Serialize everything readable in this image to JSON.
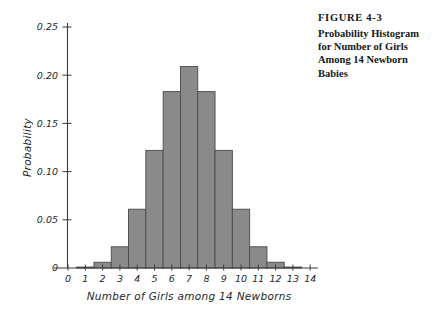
{
  "caption": {
    "figure_number": "FIGURE 4-3",
    "title_lines": [
      "Probability Histogram",
      "for Number of Girls",
      "Among 14 Newborn",
      "Babies"
    ],
    "title_text": "Probability Histogram for Number of Girls Among 14 Newborn Babies"
  },
  "colors": {
    "bar_fill": "#8a8a8a",
    "bar_stroke": "#4a4a4a",
    "axis": "#3a3a3a",
    "text": "#25282c",
    "caption_text": "#15181c",
    "background": "#ffffff"
  },
  "chart_data": {
    "type": "bar",
    "title": "",
    "xlabel": "Number of Girls among 14 Newborns",
    "ylabel": "Probability",
    "categories": [
      "0",
      "1",
      "2",
      "3",
      "4",
      "5",
      "6",
      "7",
      "8",
      "9",
      "10",
      "11",
      "12",
      "13",
      "14"
    ],
    "values": [
      0,
      0.001,
      0.006,
      0.022,
      0.061,
      0.122,
      0.183,
      0.209,
      0.183,
      0.122,
      0.061,
      0.022,
      0.006,
      0.001,
      0
    ],
    "xlim": [
      -0.5,
      14.5
    ],
    "ylim": [
      0,
      0.25
    ],
    "xticks": [
      "0",
      "1",
      "2",
      "3",
      "4",
      "5",
      "6",
      "7",
      "8",
      "9",
      "10",
      "11",
      "12",
      "13",
      "14"
    ],
    "yticks": [
      "0",
      "0.05",
      "0.10",
      "0.15",
      "0.20",
      "0.25"
    ],
    "ytick_values": [
      0,
      0.05,
      0.1,
      0.15,
      0.2,
      0.25
    ],
    "grid": false,
    "legend": false,
    "legend_position": "none"
  }
}
